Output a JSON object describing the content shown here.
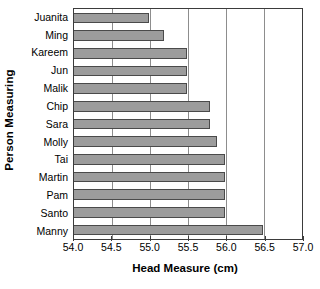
{
  "chart_data": {
    "type": "bar",
    "orientation": "horizontal",
    "title": "",
    "xlabel": "Head Measure (cm)",
    "ylabel": "Person Measuring",
    "categories": [
      "Juanita",
      "Ming",
      "Kareem",
      "Jun",
      "Malik",
      "Chip",
      "Sara",
      "Molly",
      "Tai",
      "Martin",
      "Pam",
      "Santo",
      "Manny"
    ],
    "values": [
      55.0,
      55.2,
      55.5,
      55.5,
      55.5,
      55.8,
      55.8,
      55.9,
      56.0,
      56.0,
      56.0,
      56.0,
      56.5
    ],
    "xlim": [
      54.0,
      57.0
    ],
    "xticks": [
      54.0,
      54.5,
      55.0,
      55.5,
      56.0,
      56.5,
      57.0
    ],
    "xtick_labels": [
      "54.0",
      "54.5",
      "55.0",
      "55.5",
      "56.0",
      "56.5",
      "57.0"
    ],
    "grid": "vertical",
    "legend": "none",
    "bar_color": "#9c9c9c",
    "bar_edge_color": "#4a4a4a",
    "axis_color": "#3b3b3b",
    "gridline_color": "#8d8d8d",
    "background_color": "#ffffff"
  }
}
